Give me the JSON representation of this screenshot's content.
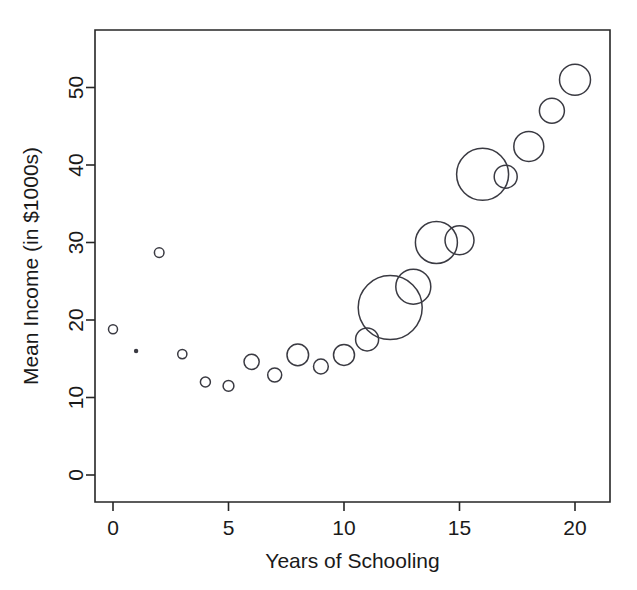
{
  "chart_data": {
    "type": "scatter",
    "title": "",
    "xlabel": "Years of Schooling",
    "ylabel": "Mean Income (in $1000s)",
    "xlim": [
      -1,
      21.5
    ],
    "ylim": [
      -3,
      55
    ],
    "xticks": [
      0,
      5,
      10,
      15,
      20
    ],
    "xtick_labels": [
      "0",
      "5",
      "10",
      "15",
      "20"
    ],
    "yticks": [
      0,
      10,
      20,
      30,
      40,
      50
    ],
    "ytick_labels": [
      "0",
      "10",
      "20",
      "30",
      "40",
      "50"
    ],
    "grid": false,
    "legend": "none",
    "marker": "open-circle",
    "size_encoding": "bubble radius proportional to group sample size",
    "x": [
      0,
      1,
      2,
      3,
      4,
      5,
      6,
      7,
      8,
      9,
      10,
      11,
      12,
      13,
      14,
      15,
      16,
      17,
      18,
      19,
      20
    ],
    "y": [
      18.8,
      16.0,
      28.7,
      15.6,
      12.0,
      11.5,
      14.6,
      12.9,
      15.5,
      14.0,
      15.5,
      17.5,
      21.6,
      24.3,
      30.0,
      30.3,
      38.8,
      38.5,
      42.4,
      47.0,
      51.0
    ],
    "r_px": [
      4.5,
      2.2,
      4.8,
      4.6,
      5.0,
      5.4,
      7.6,
      7.0,
      10.8,
      7.4,
      10.5,
      11.5,
      32.0,
      17.5,
      21.0,
      14.5,
      26.0,
      11.5,
      15.0,
      12.5,
      15.5
    ],
    "points": [
      {
        "x": 0,
        "y": 18.8,
        "r_px": 4.5
      },
      {
        "x": 1,
        "y": 16.0,
        "r_px": 2.2
      },
      {
        "x": 2,
        "y": 28.7,
        "r_px": 4.8
      },
      {
        "x": 3,
        "y": 15.6,
        "r_px": 4.6
      },
      {
        "x": 4,
        "y": 12.0,
        "r_px": 5.0
      },
      {
        "x": 5,
        "y": 11.5,
        "r_px": 5.4
      },
      {
        "x": 6,
        "y": 14.6,
        "r_px": 7.6
      },
      {
        "x": 7,
        "y": 12.9,
        "r_px": 7.0
      },
      {
        "x": 8,
        "y": 15.5,
        "r_px": 10.8
      },
      {
        "x": 9,
        "y": 14.0,
        "r_px": 7.4
      },
      {
        "x": 10,
        "y": 15.5,
        "r_px": 10.5
      },
      {
        "x": 11,
        "y": 17.5,
        "r_px": 11.5
      },
      {
        "x": 12,
        "y": 21.6,
        "r_px": 32.0
      },
      {
        "x": 13,
        "y": 24.3,
        "r_px": 17.5
      },
      {
        "x": 14,
        "y": 30.0,
        "r_px": 21.0
      },
      {
        "x": 15,
        "y": 30.3,
        "r_px": 14.5
      },
      {
        "x": 16,
        "y": 38.8,
        "r_px": 26.0
      },
      {
        "x": 17,
        "y": 38.5,
        "r_px": 11.5
      },
      {
        "x": 18,
        "y": 42.4,
        "r_px": 15.0
      },
      {
        "x": 19,
        "y": 47.0,
        "r_px": 12.5
      },
      {
        "x": 20,
        "y": 51.0,
        "r_px": 15.5
      }
    ],
    "colors": {
      "background": "#ffffff",
      "axis": "#262626",
      "marker_stroke": "#3a3a42",
      "text": "#1a1a1a"
    }
  },
  "geometry": {
    "plot_left_px": 95,
    "plot_right_px": 610,
    "plot_top_px": 30,
    "plot_bottom_px": 502,
    "x0_px": 113,
    "x_scale_px_per_unit": 23.1,
    "y0_px": 475,
    "y_scale_px_per_unit": 7.75
  }
}
